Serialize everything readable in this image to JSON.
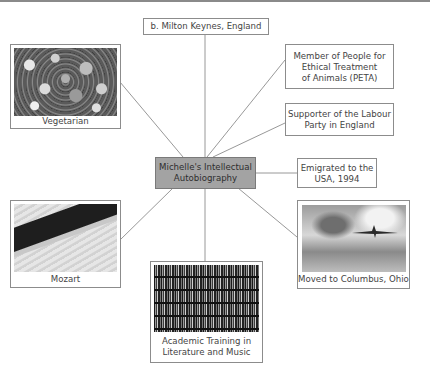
{
  "diagram": {
    "type": "mind-map",
    "center": {
      "label": "Michelle's Intellectual Autobiography",
      "line1": "Michelle's Intellectual",
      "line2": "Autobiography",
      "fill": "#a3a3a3"
    },
    "nodes": [
      {
        "id": "birthplace",
        "label": "b. Milton Keynes, England",
        "has_image": false
      },
      {
        "id": "vegetarian",
        "label": "Vegetarian",
        "has_image": true,
        "image": "vegetables-photo"
      },
      {
        "id": "peta",
        "label": "Member of People for Ethical Treatment of Animals (PETA)",
        "line1": "Member of People for",
        "line2": "Ethical Treatment",
        "line3": "of Animals (PETA)",
        "has_image": false
      },
      {
        "id": "labour",
        "label": "Supporter of the Labour Party in England",
        "line1": "Supporter of the Labour",
        "line2": "Party in England",
        "has_image": false
      },
      {
        "id": "emigrated",
        "label": "Emigrated to the USA, 1994",
        "line1": "Emigrated to the",
        "line2": "USA, 1994",
        "has_image": false
      },
      {
        "id": "columbus",
        "label": "Moved to Columbus, Ohio",
        "has_image": true,
        "image": "airplane-photo"
      },
      {
        "id": "academic",
        "label": "Academic Training in Literature and Music",
        "line1": "Academic Training in",
        "line2": "Literature and Music",
        "has_image": true,
        "image": "bookshelves-photo"
      },
      {
        "id": "mozart",
        "label": "Mozart",
        "has_image": true,
        "image": "clarinet-photo"
      }
    ]
  }
}
